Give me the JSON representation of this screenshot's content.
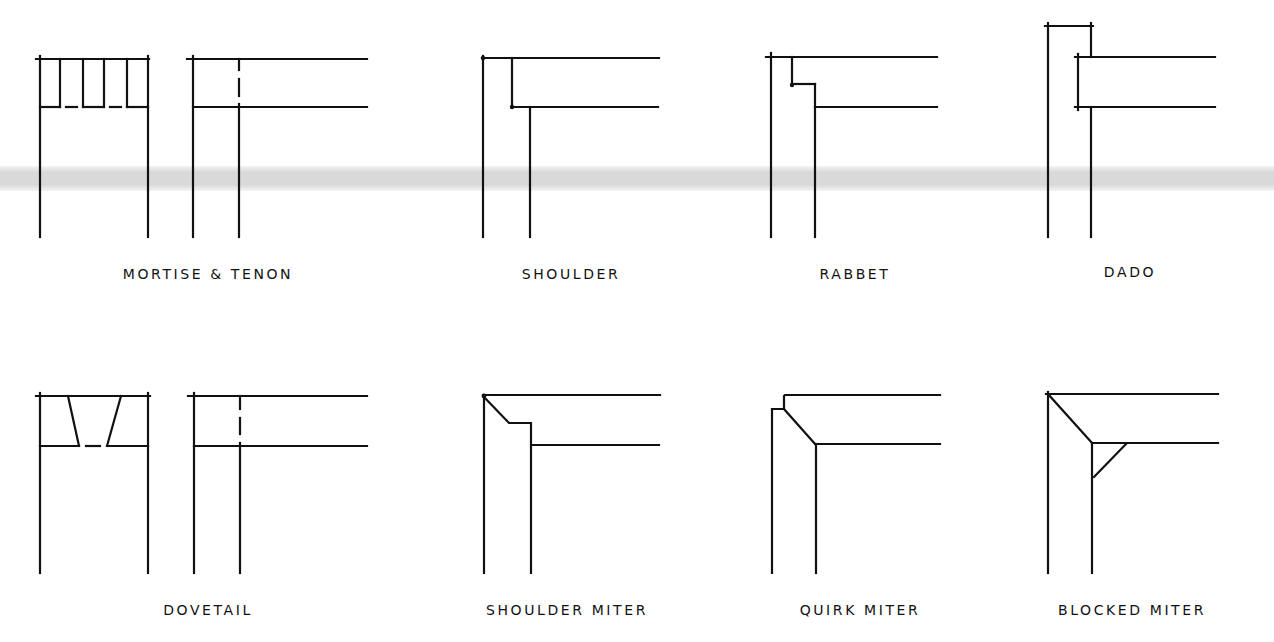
{
  "colors": {
    "ink": "#111111",
    "background": "#ffffff",
    "scan_band": "#d9d9d9"
  },
  "scan_band": {
    "top": 166,
    "height": 25
  },
  "joints": [
    {
      "id": "mortise-tenon",
      "label": "MORTISE & TENON",
      "label_x": 208,
      "label_y": 266
    },
    {
      "id": "shoulder",
      "label": "SHOULDER",
      "label_x": 571,
      "label_y": 266
    },
    {
      "id": "rabbet",
      "label": "RABBET",
      "label_x": 855,
      "label_y": 266
    },
    {
      "id": "dado",
      "label": "DADO",
      "label_x": 1130,
      "label_y": 264
    },
    {
      "id": "dovetail",
      "label": "DOVETAIL",
      "label_x": 208,
      "label_y": 602
    },
    {
      "id": "shoulder-miter",
      "label": "SHOULDER MITER",
      "label_x": 567,
      "label_y": 602
    },
    {
      "id": "quirk-miter",
      "label": "QUIRK MITER",
      "label_x": 860,
      "label_y": 602
    },
    {
      "id": "blocked-miter",
      "label": "BLOCKED MITER",
      "label_x": 1132,
      "label_y": 602
    }
  ]
}
